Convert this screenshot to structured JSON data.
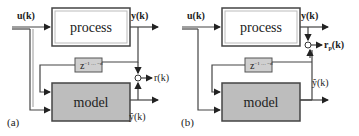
{
  "panels": [
    {
      "id": "a",
      "caption": "(a)",
      "input_label": "u(k)",
      "process_label": "process",
      "output_label": "y(k)",
      "delay_label": "z",
      "delay_sup": "−1 … −d",
      "model_label": "model",
      "estimate_label": "ŷ(k)",
      "residual_label": "r(k)"
    },
    {
      "id": "b",
      "caption": "(b)",
      "input_label": "u(k)",
      "process_label": "process",
      "output_label": "y(k)",
      "delay_label": "z",
      "delay_sup": "−1 … −d",
      "model_label": "model",
      "estimate_label": "ŷ(k)",
      "residual_label": "rp(k)"
    }
  ],
  "colors": {
    "line": "#333333",
    "model_fill": "#bdbdbd",
    "delay_fill": "#cfcfcf",
    "process_fill": "#ffffff"
  }
}
